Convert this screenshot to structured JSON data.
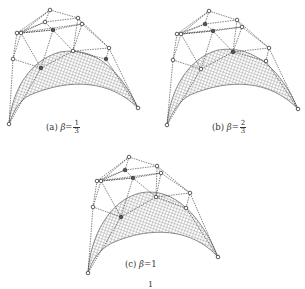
{
  "figure": {
    "panels": [
      {
        "id": "a",
        "label": "(a)",
        "symbol": "β",
        "equals": "=",
        "value_type": "fraction",
        "numerator": "1",
        "denominator": "3",
        "origin": [
          0,
          0
        ],
        "control_points": [
          [
            50,
            10
          ],
          [
            78,
            18
          ],
          [
            82,
            24
          ],
          [
            45,
            22
          ],
          [
            17,
            33
          ],
          [
            21,
            33
          ],
          [
            53,
            30
          ],
          [
            73,
            51
          ],
          [
            109,
            48
          ],
          [
            106,
            59
          ],
          [
            13,
            59
          ],
          [
            41,
            68
          ],
          [
            9,
            124
          ],
          [
            138,
            108
          ]
        ],
        "surface": {
          "left": [
            9,
            124
          ],
          "right": [
            138,
            108
          ],
          "top_peak": [
            58,
            52
          ]
        }
      },
      {
        "id": "b",
        "label": "(b)",
        "symbol": "β",
        "equals": "=",
        "value_type": "fraction",
        "numerator": "2",
        "denominator": "3",
        "origin": [
          160,
          0
        ],
        "control_points": [
          [
            209,
            11
          ],
          [
            237,
            20
          ],
          [
            242,
            27
          ],
          [
            205,
            24
          ],
          [
            177,
            34
          ],
          [
            181,
            34
          ],
          [
            213,
            31
          ],
          [
            233,
            52
          ],
          [
            269,
            48
          ],
          [
            266,
            61
          ],
          [
            173,
            60
          ],
          [
            201,
            69
          ],
          [
            167,
            125
          ],
          [
            298,
            109
          ]
        ],
        "surface": {
          "left": [
            167,
            125
          ],
          "right": [
            298,
            109
          ],
          "top_peak": [
            215,
            50
          ]
        }
      },
      {
        "id": "c",
        "label": "(c)",
        "symbol": "β",
        "equals": "=",
        "value_type": "integer",
        "value": "1",
        "origin": [
          80,
          150
        ],
        "control_points": [
          [
            129,
            157
          ],
          [
            157,
            166
          ],
          [
            161,
            173
          ],
          [
            125,
            170
          ],
          [
            97,
            181
          ],
          [
            101,
            181
          ],
          [
            133,
            178
          ],
          [
            156,
            197
          ],
          [
            190,
            193
          ],
          [
            186,
            208
          ],
          [
            93,
            207
          ],
          [
            121,
            217
          ],
          [
            88,
            273
          ],
          [
            218,
            257
          ]
        ],
        "surface": {
          "left": [
            88,
            273
          ],
          "right": [
            218,
            257
          ],
          "top_peak": [
            140,
            193
          ]
        }
      }
    ],
    "footer_page_number": "1"
  }
}
